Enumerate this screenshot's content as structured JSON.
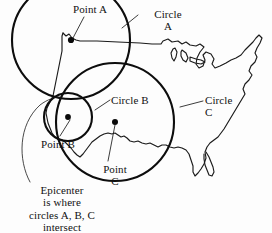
{
  "diagram": {
    "background_color": "#fdfdfd",
    "ink_color": "#111111",
    "labels": {
      "point_a": "Point A",
      "circle_a_line1": "Circle",
      "circle_a_line2": "A",
      "circle_b": "Circle B",
      "circle_c_line1": "Circle",
      "circle_c_line2": "C",
      "point_b": "Point B",
      "point_c_line1": "Point",
      "point_c_line2": "C",
      "epicenter_line1": "Epicenter",
      "epicenter_line2": "is where",
      "epicenter_line3": "circles A, B, C",
      "epicenter_line4": "intersect"
    },
    "map": {
      "name": "united-states-outline",
      "stroke_color": "#1a1a1a"
    },
    "stations": [
      {
        "id": "A",
        "label": "Point A",
        "x": 71,
        "y": 40
      },
      {
        "id": "B",
        "label": "Point B",
        "x": 68,
        "y": 117
      },
      {
        "id": "C",
        "label": "Point C",
        "x": 115,
        "y": 122
      }
    ],
    "circles": [
      {
        "id": "A",
        "label": "Circle A",
        "center_x": 71,
        "center_y": 40,
        "radius": 59
      },
      {
        "id": "B",
        "label": "Circle B",
        "center_x": 68,
        "center_y": 117,
        "radius": 24
      },
      {
        "id": "C",
        "label": "Circle C",
        "center_x": 115,
        "center_y": 122,
        "radius": 59
      }
    ],
    "epicenter": {
      "x": 62,
      "y": 97,
      "description": "Epicenter is where circles A, B, C intersect"
    }
  }
}
